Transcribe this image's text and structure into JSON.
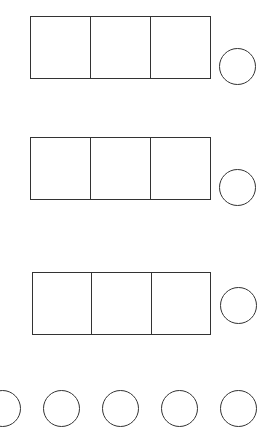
{
  "diagram": {
    "stroke_color": "#333333",
    "background": "#ffffff",
    "box_rows": [
      {
        "cells": 3,
        "has_circle": true
      },
      {
        "cells": 3,
        "has_circle": true
      },
      {
        "cells": 3,
        "has_circle": true
      }
    ],
    "bottom_circles": 5
  }
}
